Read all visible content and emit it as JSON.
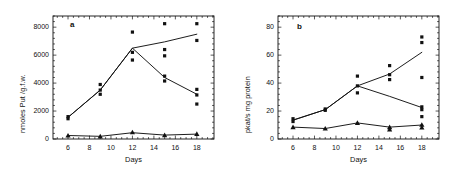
{
  "figure": {
    "background": "#ffffff",
    "ink_color": "#111111",
    "width": 450,
    "height": 179
  },
  "chart_data": [
    {
      "id": "panel-a",
      "panel_label": "a",
      "type": "scatter",
      "title": "",
      "xlabel": "Days",
      "ylabel": "nmoles Put /g.f.w.",
      "xlim": [
        4.6,
        19.6
      ],
      "ylim": [
        0,
        8800
      ],
      "xticks": [
        6,
        8,
        10,
        12,
        14,
        16,
        18
      ],
      "xtick_labels": [
        "6",
        "8",
        "10",
        "12",
        "14",
        "16",
        "18"
      ],
      "yticks": [
        0,
        2000,
        4000,
        6000,
        8000
      ],
      "ytick_labels": [
        "0",
        "2000",
        "4000",
        "6000",
        "8000"
      ],
      "x_minor_step": 0.5,
      "y_minor_step": 400,
      "grid": false,
      "legend": "none",
      "frame": "box",
      "tick_direction": "in",
      "series": [
        {
          "name": "treatment-rising",
          "marker": "square",
          "line": true,
          "x": [
            6,
            9,
            12,
            15,
            18
          ],
          "values": [
            1550,
            3500,
            6500,
            6950,
            7500
          ],
          "points": [
            {
              "x": 6,
              "y": 1600
            },
            {
              "x": 6,
              "y": 1450
            },
            {
              "x": 9,
              "y": 3900
            },
            {
              "x": 9,
              "y": 3500
            },
            {
              "x": 12,
              "y": 7650
            },
            {
              "x": 12,
              "y": 6200
            },
            {
              "x": 15,
              "y": 8250
            },
            {
              "x": 15,
              "y": 6400
            },
            {
              "x": 15,
              "y": 5950
            },
            {
              "x": 18,
              "y": 8250
            },
            {
              "x": 18,
              "y": 7050
            }
          ]
        },
        {
          "name": "control-declining",
          "marker": "square",
          "line": true,
          "x": [
            6,
            9,
            12,
            15,
            18
          ],
          "values": [
            1550,
            3500,
            6500,
            4400,
            3200
          ],
          "points": [
            {
              "x": 9,
              "y": 3200
            },
            {
              "x": 12,
              "y": 5650
            },
            {
              "x": 15,
              "y": 4500
            },
            {
              "x": 15,
              "y": 4150
            },
            {
              "x": 18,
              "y": 3550
            },
            {
              "x": 18,
              "y": 3150
            },
            {
              "x": 18,
              "y": 2500
            }
          ]
        },
        {
          "name": "baseline-low",
          "marker": "triangle",
          "line": true,
          "x": [
            6,
            9,
            12,
            15,
            18
          ],
          "values": [
            250,
            190,
            450,
            280,
            350
          ],
          "points": [
            {
              "x": 6,
              "y": 250
            },
            {
              "x": 9,
              "y": 190
            },
            {
              "x": 12,
              "y": 480
            },
            {
              "x": 15,
              "y": 280
            },
            {
              "x": 18,
              "y": 360
            }
          ]
        }
      ]
    },
    {
      "id": "panel-b",
      "panel_label": "b",
      "type": "scatter",
      "title": "",
      "xlabel": "Days",
      "ylabel": "pkat/s mg protein",
      "xlim": [
        4.6,
        19.6
      ],
      "ylim": [
        0,
        88
      ],
      "xticks": [
        6,
        8,
        10,
        12,
        14,
        16,
        18
      ],
      "xtick_labels": [
        "6",
        "8",
        "10",
        "12",
        "14",
        "16",
        "18"
      ],
      "yticks": [
        0,
        20,
        40,
        60,
        80
      ],
      "ytick_labels": [
        "0",
        "20",
        "40",
        "60",
        "80"
      ],
      "x_minor_step": 0.5,
      "y_minor_step": 4,
      "grid": false,
      "legend": "none",
      "frame": "box",
      "tick_direction": "in",
      "series": [
        {
          "name": "treatment-rising",
          "marker": "square",
          "line": true,
          "x": [
            6,
            9,
            12,
            15,
            18
          ],
          "values": [
            13.5,
            21,
            38,
            46.5,
            62
          ],
          "points": [
            {
              "x": 6,
              "y": 14.5
            },
            {
              "x": 6,
              "y": 12.5
            },
            {
              "x": 9,
              "y": 21.5
            },
            {
              "x": 9,
              "y": 20.5
            },
            {
              "x": 12,
              "y": 45
            },
            {
              "x": 12,
              "y": 38
            },
            {
              "x": 15,
              "y": 52.5
            },
            {
              "x": 15,
              "y": 46
            },
            {
              "x": 15,
              "y": 42.5
            },
            {
              "x": 18,
              "y": 73
            },
            {
              "x": 18,
              "y": 69
            }
          ]
        },
        {
          "name": "control-declining",
          "marker": "square",
          "line": true,
          "x": [
            6,
            9,
            12,
            15,
            18
          ],
          "values": [
            13.5,
            21,
            38,
            30.5,
            22.5
          ],
          "points": [
            {
              "x": 12,
              "y": 33
            },
            {
              "x": 18,
              "y": 44
            },
            {
              "x": 18,
              "y": 23
            },
            {
              "x": 18,
              "y": 21
            },
            {
              "x": 18,
              "y": 16
            }
          ]
        },
        {
          "name": "baseline-low",
          "marker": "triangle",
          "line": true,
          "x": [
            6,
            9,
            12,
            15,
            18
          ],
          "values": [
            8.5,
            7.5,
            11.5,
            8.5,
            10
          ],
          "points": [
            {
              "x": 6,
              "y": 8.5
            },
            {
              "x": 9,
              "y": 7.5
            },
            {
              "x": 12,
              "y": 11.5
            },
            {
              "x": 15,
              "y": 8.5
            },
            {
              "x": 15,
              "y": 6.8
            },
            {
              "x": 18,
              "y": 10.2
            },
            {
              "x": 18,
              "y": 8.2
            }
          ]
        }
      ]
    }
  ]
}
